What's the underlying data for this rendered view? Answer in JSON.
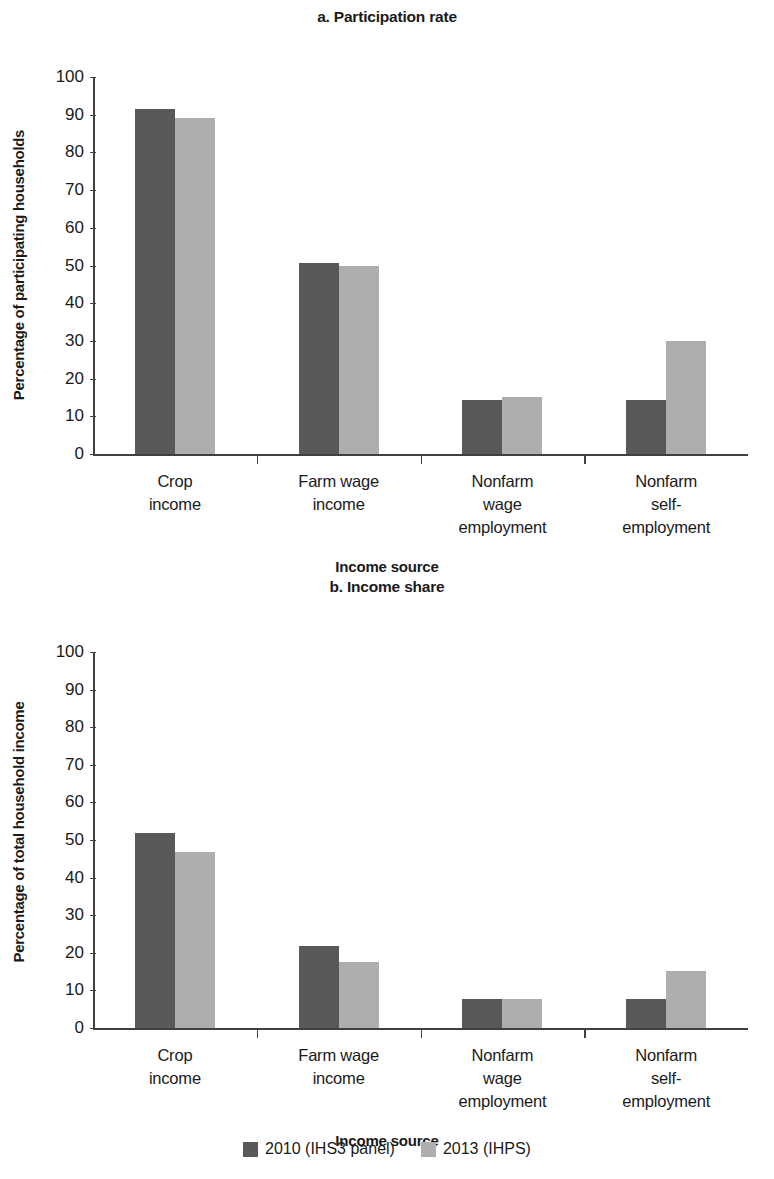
{
  "figure": {
    "legend": [
      {
        "label": "2010 (IHS3 panel)",
        "color": "#595959"
      },
      {
        "label": "2013 (IHPS)",
        "color": "#aeaeae"
      }
    ]
  },
  "chart_data": [
    {
      "type": "bar",
      "title": "a. Participation rate",
      "xlabel": "Income source",
      "ylabel": "Percentage of participating households",
      "ylim": [
        0,
        100
      ],
      "yticks": [
        0,
        10,
        20,
        30,
        40,
        50,
        60,
        70,
        80,
        90,
        100
      ],
      "ytick_labels": [
        "0",
        "10",
        "20",
        "30",
        "40",
        "50",
        "60",
        "70",
        "80",
        "90",
        "100"
      ],
      "grid": false,
      "legend_position": "bottom",
      "categories": [
        "Crop income",
        "Farm wage income",
        "Nonfarm wage employment",
        "Nonfarm self-employment"
      ],
      "category_lines": [
        [
          "Crop",
          "income"
        ],
        [
          "Farm wage",
          "income"
        ],
        [
          "Nonfarm",
          "wage",
          "employment"
        ],
        [
          "Nonfarm",
          "self-",
          "employment"
        ]
      ],
      "series": [
        {
          "name": "2010 (IHS3 panel)",
          "color": "#595959",
          "values": [
            91.5,
            50.7,
            14.3,
            14.3
          ]
        },
        {
          "name": "2013 (IHPS)",
          "color": "#aeaeae",
          "values": [
            89.1,
            49.9,
            15.1,
            30.1
          ]
        }
      ]
    },
    {
      "type": "bar",
      "title": "b. Income share",
      "xlabel": "Income source",
      "ylabel": "Percentage of total household income",
      "ylim": [
        0,
        100
      ],
      "yticks": [
        0,
        10,
        20,
        30,
        40,
        50,
        60,
        70,
        80,
        90,
        100
      ],
      "ytick_labels": [
        "0",
        "10",
        "20",
        "30",
        "40",
        "50",
        "60",
        "70",
        "80",
        "90",
        "100"
      ],
      "grid": false,
      "legend_position": "bottom",
      "categories": [
        "Crop income",
        "Farm wage income",
        "Nonfarm wage employment",
        "Nonfarm self-employment"
      ],
      "category_lines": [
        [
          "Crop",
          "income"
        ],
        [
          "Farm wage",
          "income"
        ],
        [
          "Nonfarm",
          "wage",
          "employment"
        ],
        [
          "Nonfarm",
          "self-",
          "employment"
        ]
      ],
      "series": [
        {
          "name": "2010 (IHS3 panel)",
          "color": "#595959",
          "values": [
            51.8,
            21.8,
            7.8,
            7.7
          ]
        },
        {
          "name": "2013 (IHPS)",
          "color": "#aeaeae",
          "values": [
            46.8,
            17.6,
            7.8,
            15.2
          ]
        }
      ]
    }
  ]
}
